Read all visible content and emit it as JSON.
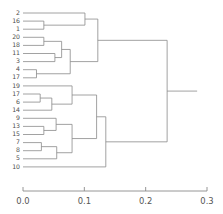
{
  "chart_data": {
    "type": "dendrogram",
    "title": "",
    "xlabel": "",
    "ylabel": "",
    "orientation": "horizontal-left-to-right",
    "xlim": [
      0.0,
      0.3
    ],
    "grid": false,
    "legend": "none",
    "axis": {
      "ticks": [
        0.0,
        0.1,
        0.2,
        0.3
      ],
      "tick_labels": [
        "0.0",
        "0.1",
        "0.2",
        "0.3"
      ],
      "position": "bottom",
      "range_px": [
        23,
        207
      ]
    },
    "leaf_labels": [
      "2",
      "16",
      "1",
      "20",
      "18",
      "11",
      "3",
      "4",
      "17",
      "19",
      "17",
      "6",
      "14",
      "9",
      "13",
      "15",
      "7",
      "8",
      "5",
      "10"
    ],
    "leaf_count": 20,
    "merges": [
      {
        "id": "m1",
        "children": [
          "16",
          "1"
        ],
        "height": 0.034
      },
      {
        "id": "m2",
        "children": [
          "2",
          "m1"
        ],
        "height": 0.101
      },
      {
        "id": "m3",
        "children": [
          "20",
          "18"
        ],
        "height": 0.034
      },
      {
        "id": "m4",
        "children": [
          "11",
          "3"
        ],
        "height": 0.052
      },
      {
        "id": "m5",
        "children": [
          "m3",
          "m4"
        ],
        "height": 0.063
      },
      {
        "id": "m6",
        "children": [
          "4",
          "17"
        ],
        "height": 0.022
      },
      {
        "id": "m7",
        "children": [
          "m5",
          "m6"
        ],
        "height": 0.077
      },
      {
        "id": "m8",
        "children": [
          "m2",
          "m7"
        ],
        "height": 0.122
      },
      {
        "id": "m9",
        "children": [
          "17",
          "6"
        ],
        "height": 0.028
      },
      {
        "id": "m10",
        "children": [
          "m9",
          "14"
        ],
        "height": 0.047
      },
      {
        "id": "m11",
        "children": [
          "19",
          "m10"
        ],
        "height": 0.08
      },
      {
        "id": "m12",
        "children": [
          "13",
          "15"
        ],
        "height": 0.034
      },
      {
        "id": "m13",
        "children": [
          "9",
          "m12"
        ],
        "height": 0.054
      },
      {
        "id": "m14",
        "children": [
          "7",
          "8"
        ],
        "height": 0.03
      },
      {
        "id": "m15",
        "children": [
          "m14",
          "5"
        ],
        "height": 0.055
      },
      {
        "id": "m16",
        "children": [
          "m13",
          "m15"
        ],
        "height": 0.08
      },
      {
        "id": "m17",
        "children": [
          "m11",
          "m16"
        ],
        "height": 0.12
      },
      {
        "id": "m18",
        "children": [
          "m17",
          "10"
        ],
        "height": 0.135
      },
      {
        "id": "m19",
        "children": [
          "m8",
          "m18"
        ],
        "height": 0.235
      }
    ],
    "root_height": 0.235,
    "colors": {
      "link": "#8a8a8a",
      "axis": "#8a8a8a",
      "label": "#4d4d4d",
      "background": "#ffffff"
    }
  }
}
